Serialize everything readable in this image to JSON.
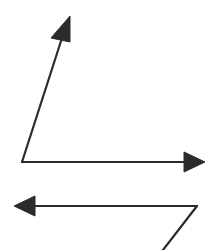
{
  "diagram": {
    "stroke_color": "#2b2b2b",
    "background": "#ffffff",
    "figures": [
      {
        "name": "angle-top",
        "vertex": [
          22,
          162
        ],
        "arrows": [
          {
            "name": "up-arrow",
            "from": [
              22,
              162
            ],
            "to": [
              70,
              16
            ]
          },
          {
            "name": "right-arrow",
            "from": [
              22,
              162
            ],
            "to": [
              205,
              162
            ]
          }
        ]
      },
      {
        "name": "angle-bottom",
        "vertex": [
          197,
          206
        ],
        "arrows": [
          {
            "name": "left-arrow",
            "from": [
              197,
              206
            ],
            "to": [
              14,
              206
            ]
          },
          {
            "name": "diagonal-line",
            "from": [
              197,
              206
            ],
            "to": [
              163,
              250
            ],
            "arrowhead": false
          }
        ]
      }
    ]
  }
}
